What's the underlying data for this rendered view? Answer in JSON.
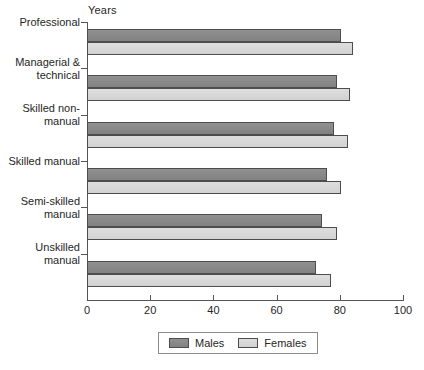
{
  "chart_data": {
    "type": "bar",
    "orientation": "horizontal",
    "title": "",
    "xlabel": "Years",
    "ylabel": "",
    "xlim": [
      0,
      100
    ],
    "xticks": [
      0,
      20,
      40,
      60,
      80,
      100
    ],
    "xtick_labels": [
      "0",
      "20",
      "40",
      "60",
      "80",
      "100"
    ],
    "grid": false,
    "legend_position": "bottom",
    "categories": [
      "Professional",
      "Managerial & technical",
      "Skilled non-manual",
      "Skilled manual",
      "Semi-skilled manual",
      "Unskilled manual"
    ],
    "category_label_lines": [
      [
        "Professional"
      ],
      [
        "Managerial &",
        "technical"
      ],
      [
        "Skilled non-",
        "manual"
      ],
      [
        "Skilled manual"
      ],
      [
        "Semi-skilled",
        "manual"
      ],
      [
        "Unskilled",
        "manual"
      ]
    ],
    "series": [
      {
        "name": "Males",
        "color": "#898989",
        "values": [
          80.4,
          79.1,
          78.2,
          76.0,
          74.4,
          72.5
        ]
      },
      {
        "name": "Females",
        "color": "#d8d8d8",
        "values": [
          84.2,
          83.2,
          82.6,
          80.4,
          79.1,
          77.2
        ]
      }
    ]
  },
  "axis": {
    "years_label": "Years"
  },
  "legend": {
    "entries": [
      {
        "label": "Males"
      },
      {
        "label": "Females"
      }
    ]
  },
  "colors": {
    "males": "#898989",
    "females": "#d8d8d8",
    "axis": "#555555",
    "bar_border": "#4d4d4d",
    "text": "#262626",
    "background": "#ffffff"
  }
}
